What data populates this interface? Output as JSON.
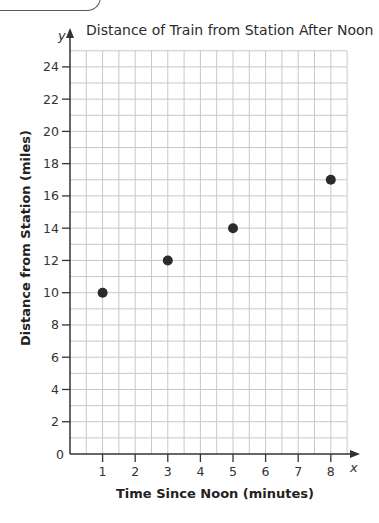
{
  "chart_data": {
    "type": "scatter",
    "title": "Distance of Train from Station After Noon",
    "xlabel": "Time Since Noon (minutes)",
    "ylabel": "Distance from Station (miles)",
    "x_axis_var": "x",
    "y_axis_var": "y",
    "xlim": [
      0,
      8.5
    ],
    "ylim": [
      0,
      25
    ],
    "x_ticks": [
      1,
      2,
      3,
      4,
      5,
      6,
      7,
      8
    ],
    "y_ticks": [
      0,
      2,
      4,
      6,
      8,
      10,
      12,
      14,
      16,
      18,
      20,
      22,
      24
    ],
    "grid": true,
    "grid_minor_x_step": 0.5,
    "grid_minor_y_step": 1,
    "points": [
      {
        "x": 1,
        "y": 10
      },
      {
        "x": 3,
        "y": 12
      },
      {
        "x": 5,
        "y": 14
      },
      {
        "x": 8,
        "y": 17
      }
    ],
    "colors": {
      "point": "#2b2b2b",
      "grid": "#c8c8c8",
      "axis": "#333333"
    }
  }
}
